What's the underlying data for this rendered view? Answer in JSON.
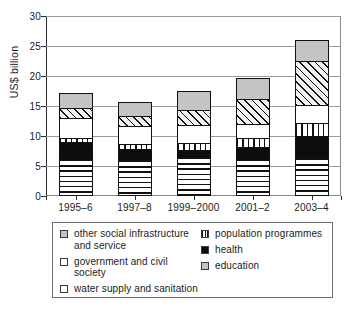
{
  "chart_data": {
    "type": "bar",
    "subtype": "stacked-bar",
    "title": "",
    "xlabel": "",
    "ylabel": "US$ billion",
    "ylim": [
      0,
      30
    ],
    "ytick_labels": [
      "0",
      "5",
      "10",
      "15",
      "20",
      "25",
      "30"
    ],
    "ytick_values": [
      0,
      5,
      10,
      15,
      20,
      25,
      30
    ],
    "grid": true,
    "grid_axis": "y",
    "legend_position": "bottom",
    "categories": [
      "1995–6",
      "1997–8",
      "1999–2000",
      "2001–2",
      "2003–4"
    ],
    "series": [
      {
        "name": "other social infrastructure and service",
        "pattern": "horizontal-stripes",
        "values": [
          5.9,
          5.6,
          6.1,
          5.9,
          6.0
        ]
      },
      {
        "name": "health",
        "pattern": "solid-black",
        "values": [
          2.8,
          1.9,
          1.3,
          2.0,
          3.6
        ]
      },
      {
        "name": "population programmes",
        "pattern": "vertical-stripes",
        "values": [
          0.6,
          0.8,
          1.1,
          1.4,
          2.3
        ]
      },
      {
        "name": "water supply and sanitation",
        "pattern": "white",
        "values": [
          3.4,
          3.0,
          3.0,
          2.4,
          2.9
        ]
      },
      {
        "name": "government and civil society",
        "pattern": "diagonal-hatch",
        "values": [
          1.7,
          1.7,
          2.5,
          4.1,
          7.4
        ]
      },
      {
        "name": "education",
        "pattern": "grey",
        "values": [
          2.4,
          2.3,
          3.1,
          3.5,
          3.4
        ]
      }
    ],
    "totals": [
      16.8,
      15.3,
      17.1,
      19.3,
      25.6
    ]
  },
  "legend": {
    "left_column": [
      {
        "label": "other social infrastructure and service",
        "swatch": "grey"
      },
      {
        "label": "government and civil society",
        "swatch": "white"
      },
      {
        "label": "water supply and sanitation",
        "swatch": "white"
      }
    ],
    "right_column": [
      {
        "label": "population programmes",
        "swatch": "vertical-stripes"
      },
      {
        "label": "health",
        "swatch": "solid-black"
      },
      {
        "label": "education",
        "swatch": "grey"
      }
    ]
  },
  "colors": {
    "grey_fill": "#c4c4c4",
    "black_fill": "#0d0d0d",
    "white_fill": "#ffffff",
    "outline": "#111111",
    "gridline": "#9a9a9a",
    "axis": "#2b2b2b"
  }
}
